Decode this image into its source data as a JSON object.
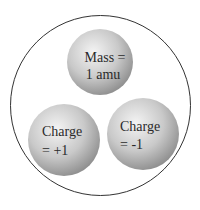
{
  "diagram": {
    "title": "",
    "particles": [
      {
        "id": "mass",
        "lines": [
          "Mass =",
          "1 amu"
        ]
      },
      {
        "id": "positive",
        "lines": [
          "Charge",
          "= +1"
        ]
      },
      {
        "id": "negative",
        "lines": [
          "Charge",
          "= -1"
        ]
      }
    ]
  }
}
